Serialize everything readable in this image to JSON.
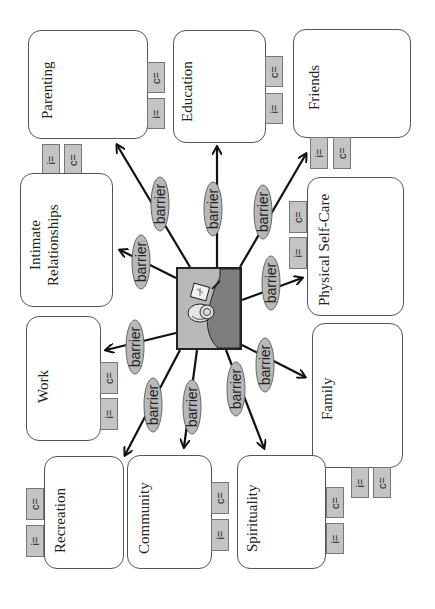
{
  "diagram": {
    "orientation": "rotated 90 degrees counter-clockwise",
    "center": {
      "icon": "snail-with-paper-icon",
      "fill": "#b9b9b9"
    },
    "barrier_label": "barrier",
    "tag_labels": {
      "importance": "i=",
      "consistency": "c="
    },
    "colors": {
      "tag_fill": "#c4c4c4",
      "oval_fill": "#b8b8b8",
      "box_border": "#555555",
      "arrow": "#111111"
    },
    "domains": [
      {
        "id": "parenting",
        "label": "Parenting"
      },
      {
        "id": "education",
        "label": "Education"
      },
      {
        "id": "friends",
        "label": "Friends"
      },
      {
        "id": "intimate",
        "label_line1": "Intimate",
        "label_line2": "Relationships"
      },
      {
        "id": "selfcare",
        "label": "Physical Self-Care"
      },
      {
        "id": "work",
        "label": "Work"
      },
      {
        "id": "family",
        "label": "Family"
      },
      {
        "id": "recreation",
        "label": "Recreation"
      },
      {
        "id": "community",
        "label": "Community"
      },
      {
        "id": "spirituality",
        "label": "Spirituality"
      }
    ]
  }
}
